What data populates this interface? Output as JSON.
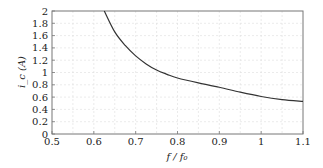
{
  "chart_data": {
    "type": "line",
    "title": "",
    "xlabel": "f / f₀",
    "ylabel": "i_c (A)",
    "xlim": [
      0.5,
      1.1
    ],
    "ylim": [
      0,
      2
    ],
    "grid": true,
    "legend": "none",
    "xticks": [
      0.5,
      0.6,
      0.7,
      0.8,
      0.9,
      1.0,
      1.1
    ],
    "xtick_labels": [
      "0.5",
      "0.6",
      "0.7",
      "0.8",
      "0.9",
      "1",
      "1.1"
    ],
    "yticks": [
      0,
      0.2,
      0.4,
      0.6,
      0.8,
      1.0,
      1.2,
      1.4,
      1.6,
      1.8,
      2.0
    ],
    "ytick_labels": [
      "0",
      "0.2",
      "0.4",
      "0.6",
      "0.8",
      "1",
      "1.2",
      "1.4",
      "1.6",
      "1.8",
      "2"
    ],
    "series": [
      {
        "name": "i_c",
        "color": "#333333",
        "x": [
          0.625,
          0.65,
          0.675,
          0.7,
          0.725,
          0.75,
          0.775,
          0.8,
          0.85,
          0.9,
          0.95,
          1.0,
          1.05,
          1.1
        ],
        "y": [
          2.0,
          1.66,
          1.44,
          1.27,
          1.14,
          1.04,
          0.97,
          0.91,
          0.83,
          0.76,
          0.68,
          0.61,
          0.56,
          0.53
        ]
      }
    ]
  }
}
